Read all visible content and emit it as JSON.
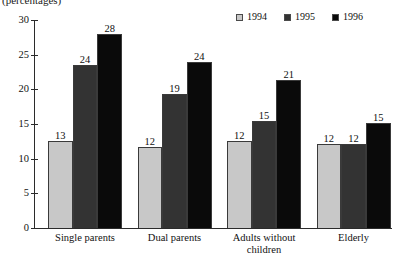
{
  "chart_data": {
    "type": "bar",
    "title": "(percentages)",
    "xlabel": "",
    "ylabel": "",
    "ylim": [
      0,
      30
    ],
    "yticks": [
      0,
      5,
      10,
      15,
      20,
      25,
      30
    ],
    "ytick_labels": [
      "0",
      "5",
      "10",
      "15",
      "20",
      "25",
      "30"
    ],
    "grid": false,
    "legend_position": "top-right",
    "categories": [
      "Single parents",
      "Dual parents",
      "Adults without\nchildren",
      "Elderly"
    ],
    "series": [
      {
        "name": "1994",
        "color": "#c8c8c8",
        "values": [
          13,
          12,
          12,
          12
        ],
        "bar_tops": [
          12.6,
          11.7,
          12.5,
          12.1
        ]
      },
      {
        "name": "1995",
        "color": "#333333",
        "values": [
          24,
          19,
          15,
          12
        ],
        "bar_tops": [
          23.5,
          19.3,
          15.4,
          12.1
        ]
      },
      {
        "name": "1996",
        "color": "#0a0a0a",
        "values": [
          28,
          24,
          21,
          15
        ],
        "bar_tops": [
          28.0,
          23.9,
          21.3,
          15.1
        ]
      }
    ]
  },
  "legend": {
    "items": [
      {
        "label": "1994",
        "color": "#c8c8c8"
      },
      {
        "label": "1995",
        "color": "#333333"
      },
      {
        "label": "1996",
        "color": "#0a0a0a"
      }
    ]
  },
  "axis": {
    "y_labels": [
      "30",
      "25",
      "20",
      "15",
      "10",
      "5",
      "0"
    ]
  }
}
